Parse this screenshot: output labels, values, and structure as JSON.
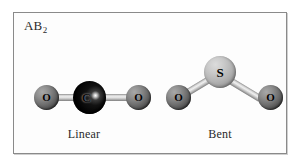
{
  "figure": {
    "corner_label": {
      "base": "AB",
      "subscript": "2"
    },
    "border_color": "#8a8a8a",
    "background_color": "#ffffff"
  },
  "molecules": [
    {
      "id": "linear",
      "caption": "Linear",
      "geometry": "linear",
      "bond_angle_degrees": 180,
      "atoms": [
        {
          "element": "O",
          "label": "O",
          "role": "terminal-left",
          "color": "#6e6e6e"
        },
        {
          "element": "C",
          "label": "C",
          "role": "central",
          "color": "#000000"
        },
        {
          "element": "O",
          "label": "O",
          "role": "terminal-right",
          "color": "#6e6e6e"
        }
      ],
      "bond_color": "#c4c4c4"
    },
    {
      "id": "bent",
      "caption": "Bent",
      "geometry": "bent",
      "bond_angle_degrees": 120,
      "atoms": [
        {
          "element": "O",
          "label": "O",
          "role": "terminal-left",
          "color": "#6e6e6e"
        },
        {
          "element": "S",
          "label": "S",
          "role": "central",
          "color": "#c9c9c9"
        },
        {
          "element": "O",
          "label": "O",
          "role": "terminal-right",
          "color": "#6e6e6e"
        }
      ],
      "bond_color": "#c4c4c4"
    }
  ]
}
